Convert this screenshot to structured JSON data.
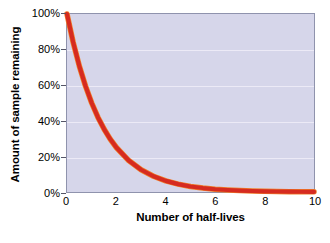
{
  "chart_data": {
    "type": "line",
    "title": "",
    "xlabel": "Number of half-lives",
    "ylabel": "Amount of sample remaining",
    "xlim": [
      0,
      10
    ],
    "ylim": [
      0,
      100
    ],
    "grid": true,
    "legend": "none",
    "x_ticks": [
      "0",
      "2",
      "4",
      "6",
      "8",
      "10"
    ],
    "x_tick_values": [
      0,
      2,
      4,
      6,
      8,
      10
    ],
    "y_ticks": [
      "0%",
      "20%",
      "40%",
      "60%",
      "80%",
      "100%"
    ],
    "y_tick_values": [
      0,
      20,
      40,
      60,
      80,
      100
    ],
    "series": [
      {
        "name": "Amount of sample remaining",
        "color": "#d62b20",
        "highlight_color": "#f07f2a",
        "equation": "y = 100 * (0.5)^x",
        "x": [
          0,
          0.25,
          0.5,
          0.75,
          1,
          1.25,
          1.5,
          1.75,
          2,
          2.5,
          3,
          3.5,
          4,
          4.5,
          5,
          5.5,
          6,
          6.5,
          7,
          7.5,
          8,
          8.5,
          9,
          9.5,
          10
        ],
        "values": [
          100,
          84.09,
          70.71,
          59.46,
          50,
          42.04,
          35.36,
          29.73,
          25,
          17.68,
          12.5,
          8.84,
          6.25,
          4.42,
          3.125,
          2.21,
          1.5625,
          1.1,
          0.781,
          0.55,
          0.39,
          0.276,
          0.195,
          0.138,
          0.098
        ]
      }
    ],
    "colors": {
      "plot_background": "#d6d6ea",
      "gridline": "#eceaf6",
      "plot_border": "#8f93ad",
      "curve": "#d62b20",
      "page_background": "#ffffff",
      "text": "#000000"
    }
  }
}
